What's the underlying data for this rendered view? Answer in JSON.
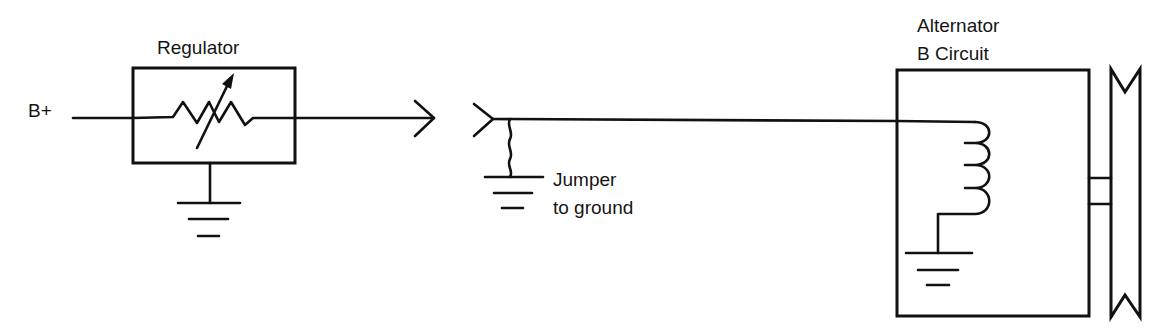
{
  "diagram": {
    "colors": {
      "ink": "#111111",
      "background": "#ffffff"
    },
    "labels": {
      "battery_positive": "B+",
      "regulator": "Regulator",
      "alternator_line1": "Alternator",
      "alternator_line2": "B Circuit",
      "jumper_line1": "Jumper",
      "jumper_line2": "to ground"
    },
    "components": [
      {
        "id": "battery-positive-terminal",
        "type": "terminal",
        "label": "B+"
      },
      {
        "id": "regulator",
        "type": "variable-resistor-box",
        "label": "Regulator",
        "grounded": true
      },
      {
        "id": "connector",
        "type": "disconnected-connector",
        "halves": [
          "male",
          "female"
        ]
      },
      {
        "id": "jumper",
        "type": "jumper-wire",
        "label": "Jumper to ground"
      },
      {
        "id": "alternator",
        "type": "field-coil-box",
        "label": "Alternator B Circuit",
        "grounded": true
      },
      {
        "id": "pulley",
        "type": "pulley"
      }
    ],
    "icons": [
      "ground-symbol",
      "variable-resistor-symbol",
      "coil-symbol",
      "connector-symbol",
      "pulley-symbol"
    ]
  }
}
